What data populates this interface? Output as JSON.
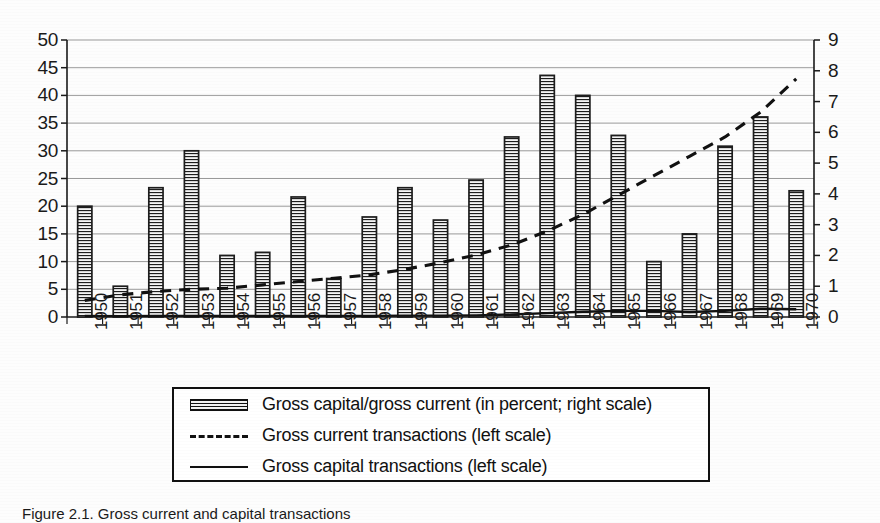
{
  "chart_data": {
    "type": "bar",
    "title": "",
    "subtitle": "",
    "xlabel": "",
    "ylabel": "",
    "grid": true,
    "legend_position": "bottom",
    "categories": [
      "1950",
      "1951",
      "1952",
      "1953",
      "1954",
      "1955",
      "1956",
      "1957",
      "1958",
      "1959",
      "1960",
      "1961",
      "1962",
      "1963",
      "1964",
      "1965",
      "1966",
      "1967",
      "1968",
      "1969",
      "1970"
    ],
    "left_axis": {
      "label": "",
      "min": 0,
      "max": 50,
      "step": 5,
      "ticks": [
        "0",
        "5",
        "10",
        "15",
        "20",
        "25",
        "30",
        "35",
        "40",
        "45",
        "50"
      ]
    },
    "right_axis": {
      "label": "",
      "min": 0,
      "max": 9,
      "step": 1,
      "ticks": [
        "0",
        "1",
        "2",
        "3",
        "4",
        "5",
        "6",
        "7",
        "8",
        "9"
      ]
    },
    "series": [
      {
        "name": "Gross capital/gross current (in percent; right scale)",
        "type": "bar",
        "axis": "right",
        "style": "hatched-horizontal",
        "color": "#111111",
        "values": [
          3.6,
          1.0,
          4.2,
          5.4,
          2.0,
          2.1,
          3.9,
          1.25,
          3.25,
          4.2,
          3.15,
          4.45,
          5.85,
          7.85,
          7.2,
          5.9,
          1.8,
          2.7,
          5.55,
          6.5,
          4.1
        ]
      },
      {
        "name": "Gross current transactions (left scale)",
        "type": "line",
        "axis": "left",
        "style": "dashed",
        "color": "#111111",
        "values": [
          3.0,
          4.0,
          4.6,
          5.0,
          5.2,
          5.8,
          6.4,
          7.0,
          7.6,
          8.6,
          9.8,
          11.2,
          13.0,
          15.5,
          18.5,
          22.0,
          25.5,
          29.0,
          32.5,
          37.0,
          43.0
        ]
      },
      {
        "name": "Gross capital transactions (left scale)",
        "type": "line",
        "axis": "left",
        "style": "solid",
        "color": "#111111",
        "values": [
          0.2,
          0.15,
          0.2,
          0.2,
          0.2,
          0.2,
          0.2,
          0.2,
          0.2,
          0.25,
          0.25,
          0.3,
          0.45,
          0.7,
          0.95,
          1.1,
          1.1,
          0.9,
          1.1,
          1.5,
          1.4
        ]
      }
    ]
  },
  "legend": {
    "items": [
      {
        "swatch": "hatched-bar-swatch",
        "label": "Gross capital/gross current (in percent; right scale)"
      },
      {
        "swatch": "dashed-line-swatch",
        "label": "Gross current transactions (left scale)"
      },
      {
        "swatch": "solid-line-swatch",
        "label": "Gross capital transactions (left scale)"
      }
    ]
  },
  "caption": {
    "text": "Figure 2.1. Gross current and capital transactions"
  }
}
